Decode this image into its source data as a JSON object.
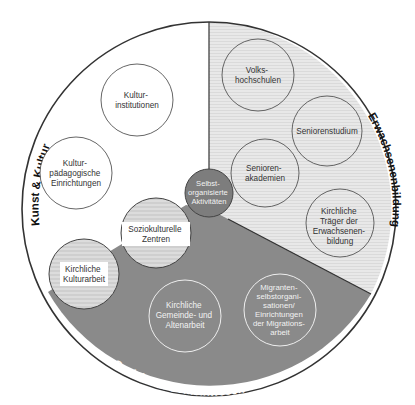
{
  "diagram": {
    "type": "sector-circle-diagram",
    "colors": {
      "background": "#ffffff",
      "outline": "#333333",
      "sector_kunst": "#ffffff",
      "sector_erwachsenen": "#e4e4e4",
      "sector_soziales": "#8c8c8c",
      "center_circle": "#7d7d7d",
      "overlap_circle": "#d9d9d9",
      "label_dark": "#333333",
      "label_light": "#f2f2f2"
    },
    "sectors": [
      {
        "id": "kunst",
        "title": "Kunst & Kultur"
      },
      {
        "id": "erwachsenen",
        "title": "Erwachsenenbildung"
      },
      {
        "id": "soziales",
        "title": "Soziales & Gemeinwesen"
      }
    ],
    "nodes": [
      {
        "id": "kulturinstitutionen",
        "sector": "kunst",
        "lines": [
          "Kultur-",
          "institutionen"
        ]
      },
      {
        "id": "kulturpaedagogische",
        "sector": "kunst",
        "lines": [
          "Kultur-",
          "pädagogische",
          "Einrichtungen"
        ]
      },
      {
        "id": "volkshochschulen",
        "sector": "erwachsenen",
        "lines": [
          "Volks-",
          "hochschulen"
        ]
      },
      {
        "id": "seniorenstudium",
        "sector": "erwachsenen",
        "lines": [
          "Seniorenstudium"
        ]
      },
      {
        "id": "seniorenakademien",
        "sector": "erwachsenen",
        "lines": [
          "Senioren-",
          "akademien"
        ]
      },
      {
        "id": "kirchliche-traeger",
        "sector": "erwachsenen",
        "lines": [
          "Kirchliche",
          "Träger der",
          "Erwachsenen-",
          "bildung"
        ]
      },
      {
        "id": "selbstorganisierte",
        "sector": "center",
        "lines": [
          "Selbst-",
          "organisierte",
          "Aktivitäten"
        ]
      },
      {
        "id": "soziokulturelle",
        "sector": "kunst/soziales",
        "lines": [
          "Soziokulturelle",
          "Zentren"
        ]
      },
      {
        "id": "kirchliche-kulturarbeit",
        "sector": "kunst/soziales",
        "lines": [
          "Kirchliche",
          "Kulturarbeit"
        ]
      },
      {
        "id": "kirchliche-gemeinde",
        "sector": "soziales",
        "lines": [
          "Kirchliche",
          "Gemeinde- und",
          "Altenarbeit"
        ]
      },
      {
        "id": "migranten",
        "sector": "soziales",
        "lines": [
          "Migranten-",
          "selbstorgani-",
          "sationen/",
          "Einrichtungen",
          "der Migrations-",
          "arbeit"
        ]
      }
    ]
  }
}
